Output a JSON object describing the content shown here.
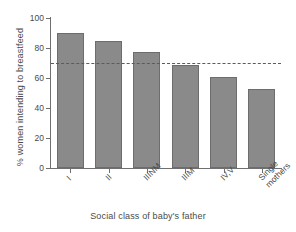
{
  "chart_data": {
    "type": "bar",
    "title": "",
    "subtitle": "",
    "xlabel": "Social class of baby's father",
    "ylabel": "% women intending to breastfeed",
    "categories": [
      "I",
      "II",
      "IIINM",
      "IIIM",
      "IV,V",
      "Single\nmothers"
    ],
    "values": [
      90,
      85,
      77.5,
      68.5,
      61,
      53
    ],
    "series": [
      {
        "name": "% women intending to breastfeed",
        "values": [
          90,
          85,
          77.5,
          68.5,
          61,
          53
        ]
      }
    ],
    "ylim": [
      0,
      100
    ],
    "yticks": [
      0,
      20,
      40,
      60,
      80,
      100
    ],
    "ytick_labels": [
      "0",
      "20",
      "40",
      "60",
      "80",
      "100"
    ],
    "grid": false,
    "legend": "none",
    "annotations": [
      {
        "kind": "reference-line",
        "orientation": "horizontal",
        "value": 70,
        "style": "dashed",
        "label": ""
      }
    ],
    "colors": {
      "bar_fill": "#8a8a8a",
      "bar_edge": "#6d6d6d",
      "axis": "#6f6f6f",
      "text": "#4a4a4a",
      "reference_line": "#5b5b5b",
      "background": "#ffffff"
    }
  }
}
